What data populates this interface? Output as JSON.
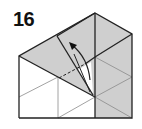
{
  "step": {
    "number": "16"
  },
  "colors": {
    "paper_colored": "#cfcfcf",
    "paper_white": "#ffffff",
    "edge": "#222222",
    "crease": "#888888"
  },
  "diagram": {
    "symbols": [
      "valley-fold-dashed-line",
      "fold-arrow"
    ]
  }
}
